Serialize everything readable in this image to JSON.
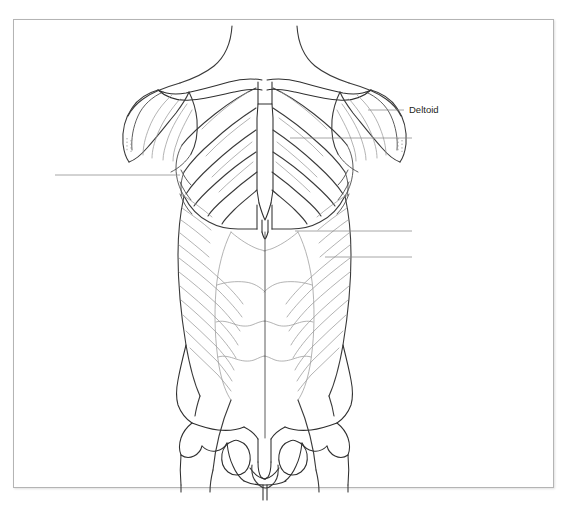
{
  "document": {
    "type": "anatomy-worksheet",
    "subject": "Anterior torso musculature",
    "background_color": "#ffffff",
    "frame": {
      "border_color": "#b4b4b4",
      "x": 13,
      "y": 19,
      "width": 541,
      "height": 469
    }
  },
  "figure": {
    "name": "anterior-torso-muscle-diagram",
    "view": "anterior",
    "line_colors": {
      "outline": "#3a3a3a",
      "muscle_fiber": "#9a9a9a",
      "bone": "#2f2f2f",
      "leader_line": "#8a8a8a"
    },
    "structures": [
      "neck",
      "clavicle-left",
      "clavicle-right",
      "deltoid-left",
      "deltoid-right",
      "pectoralis-major-left",
      "pectoralis-major-right",
      "sternum-manubrium",
      "sternum-body",
      "xiphoid-process",
      "serratus-anterior-left",
      "serratus-anterior-right",
      "external-oblique-left",
      "external-oblique-right",
      "rectus-abdominis",
      "linea-alba",
      "tendinous-intersections",
      "iliac-crest-left",
      "iliac-crest-right",
      "pubic-symphysis",
      "obturator-foramen-left",
      "obturator-foramen-right",
      "femoral-head-left",
      "femoral-head-right"
    ]
  },
  "labels": [
    {
      "id": "deltoid",
      "text": "Deltoid",
      "text_x": 409,
      "text_y": 110,
      "leader": {
        "x1": 368,
        "y1": 110,
        "x2": 404,
        "y2": 110
      },
      "side": "right",
      "filled": true
    },
    {
      "id": "blank-left-1",
      "text": "",
      "text_x": 0,
      "text_y": 175,
      "leader": {
        "x1": 55,
        "y1": 175,
        "x2": 180,
        "y2": 175
      },
      "side": "left",
      "filled": false
    },
    {
      "id": "blank-right-1",
      "text": "",
      "text_x": 0,
      "text_y": 138,
      "leader": {
        "x1": 290,
        "y1": 138,
        "x2": 412,
        "y2": 138
      },
      "side": "right",
      "filled": false
    },
    {
      "id": "blank-right-2",
      "text": "",
      "text_x": 0,
      "text_y": 231,
      "leader": {
        "x1": 295,
        "y1": 231,
        "x2": 412,
        "y2": 231
      },
      "side": "right",
      "filled": false
    },
    {
      "id": "blank-right-3",
      "text": "",
      "text_x": 0,
      "text_y": 257,
      "leader": {
        "x1": 325,
        "y1": 257,
        "x2": 412,
        "y2": 257
      },
      "side": "right",
      "filled": false
    }
  ]
}
